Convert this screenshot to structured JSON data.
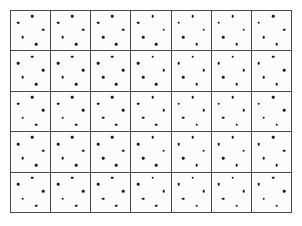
{
  "figure": {
    "background_color": "#ffffff",
    "cell_background_color": "#fcfcfc",
    "line_color": "#4a4a4a",
    "dot_color": "#1d1d1d",
    "columns": 7,
    "rows": 5,
    "dots_per_cell": 5,
    "total_cells": 35,
    "total_dots": 175,
    "dot_pattern_name": "rotated-quincunx",
    "dot_positions_percent": [
      {
        "x": 18,
        "y": 30
      },
      {
        "x": 54,
        "y": 13
      },
      {
        "x": 82,
        "y": 47
      },
      {
        "x": 30,
        "y": 66
      },
      {
        "x": 64,
        "y": 84
      }
    ],
    "cells": [
      {
        "row": 1,
        "col": 1
      },
      {
        "row": 1,
        "col": 2
      },
      {
        "row": 1,
        "col": 3
      },
      {
        "row": 1,
        "col": 4
      },
      {
        "row": 1,
        "col": 5
      },
      {
        "row": 1,
        "col": 6
      },
      {
        "row": 1,
        "col": 7
      },
      {
        "row": 2,
        "col": 1
      },
      {
        "row": 2,
        "col": 2
      },
      {
        "row": 2,
        "col": 3
      },
      {
        "row": 2,
        "col": 4
      },
      {
        "row": 2,
        "col": 5
      },
      {
        "row": 2,
        "col": 6
      },
      {
        "row": 2,
        "col": 7
      },
      {
        "row": 3,
        "col": 1
      },
      {
        "row": 3,
        "col": 2
      },
      {
        "row": 3,
        "col": 3
      },
      {
        "row": 3,
        "col": 4
      },
      {
        "row": 3,
        "col": 5
      },
      {
        "row": 3,
        "col": 6
      },
      {
        "row": 3,
        "col": 7
      },
      {
        "row": 4,
        "col": 1
      },
      {
        "row": 4,
        "col": 2
      },
      {
        "row": 4,
        "col": 3
      },
      {
        "row": 4,
        "col": 4
      },
      {
        "row": 4,
        "col": 5
      },
      {
        "row": 4,
        "col": 6
      },
      {
        "row": 4,
        "col": 7
      },
      {
        "row": 5,
        "col": 1
      },
      {
        "row": 5,
        "col": 2
      },
      {
        "row": 5,
        "col": 3
      },
      {
        "row": 5,
        "col": 4
      },
      {
        "row": 5,
        "col": 5
      },
      {
        "row": 5,
        "col": 6
      },
      {
        "row": 5,
        "col": 7
      }
    ]
  }
}
